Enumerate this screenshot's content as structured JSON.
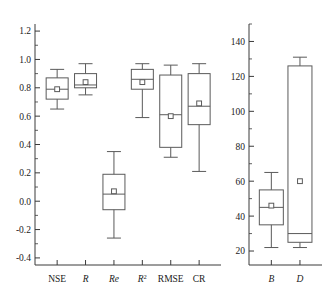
{
  "chart_data": [
    {
      "type": "box",
      "panel": "left",
      "title": "",
      "xlabel": "",
      "ylabel": "",
      "ylim": [
        -0.45,
        1.25
      ],
      "yticks": [
        -0.4,
        -0.2,
        0.0,
        0.2,
        0.4,
        0.6,
        0.8,
        1.0,
        1.2
      ],
      "ytick_labels": [
        "-0.4",
        "-0.2",
        "0.0",
        "0.2",
        "0.4",
        "0.6",
        "0.8",
        "1.0",
        "1.2"
      ],
      "minor_ticks": true,
      "grid": false,
      "legend": "none",
      "categories": [
        "NSE",
        "R",
        "Re",
        "R²",
        "RMSE",
        "CR"
      ],
      "category_styles": [
        "upright",
        "italic",
        "italic",
        "italic-sup2",
        "upright",
        "upright"
      ],
      "boxes": [
        {
          "name": "NSE",
          "whisker_low": 0.65,
          "q1": 0.72,
          "median": 0.79,
          "q3": 0.87,
          "whisker_high": 0.93,
          "mean": 0.79
        },
        {
          "name": "R",
          "whisker_low": 0.75,
          "q1": 0.8,
          "median": 0.82,
          "q3": 0.9,
          "whisker_high": 0.97,
          "mean": 0.84
        },
        {
          "name": "Re",
          "whisker_low": -0.26,
          "q1": -0.06,
          "median": 0.05,
          "q3": 0.19,
          "whisker_high": 0.35,
          "mean": 0.07
        },
        {
          "name": "R2",
          "whisker_low": 0.59,
          "q1": 0.79,
          "median": 0.86,
          "q3": 0.93,
          "whisker_high": 0.97,
          "mean": 0.84
        },
        {
          "name": "RMSE",
          "whisker_low": 0.31,
          "q1": 0.38,
          "median": 0.61,
          "q3": 0.89,
          "whisker_high": 0.96,
          "mean": 0.6
        },
        {
          "name": "CR",
          "whisker_low": 0.21,
          "q1": 0.54,
          "median": 0.67,
          "q3": 0.9,
          "whisker_high": 0.97,
          "mean": 0.69
        }
      ]
    },
    {
      "type": "box",
      "panel": "right",
      "title": "",
      "xlabel": "",
      "ylabel": "",
      "ylim": [
        12,
        150
      ],
      "yticks": [
        20,
        40,
        60,
        80,
        100,
        120,
        140
      ],
      "ytick_labels": [
        "20",
        "40",
        "60",
        "80",
        "100",
        "120",
        "140"
      ],
      "minor_ticks": true,
      "grid": false,
      "legend": "none",
      "categories": [
        "B",
        "D"
      ],
      "category_styles": [
        "italic",
        "italic"
      ],
      "boxes": [
        {
          "name": "B",
          "whisker_low": 22,
          "q1": 35,
          "median": 45,
          "q3": 55,
          "whisker_high": 65,
          "mean": 46
        },
        {
          "name": "D",
          "whisker_low": 22,
          "q1": 25,
          "median": 30,
          "q3": 126,
          "whisker_high": 131,
          "mean": 60
        }
      ]
    }
  ],
  "colors": {
    "axis": "#3a3a3a",
    "box_stroke": "#5a5a5a",
    "background": "#ffffff",
    "text": "#1a1a1a"
  }
}
